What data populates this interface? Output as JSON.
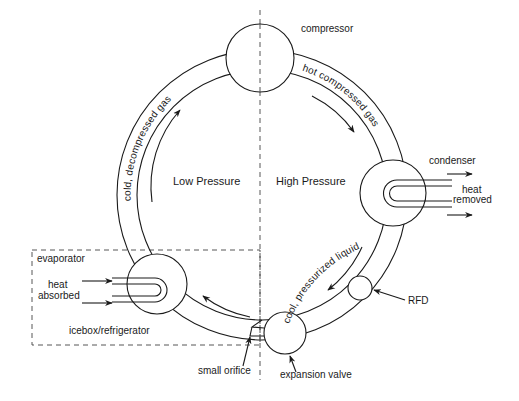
{
  "diagram": {
    "regions": {
      "low_pressure": "Low Pressure",
      "high_pressure": "High Pressure"
    },
    "components": {
      "compressor": "compressor",
      "condenser": "condenser",
      "rfd": "RFD",
      "expansion_valve": "expansion valve",
      "small_orifice": "small orifice",
      "evaporator": "evaporator",
      "icebox": "icebox/refrigerator"
    },
    "heat_labels": {
      "removed_line1": "heat",
      "removed_line2": "removed",
      "absorbed_line1": "heat",
      "absorbed_line2": "absorbed"
    },
    "pipe_labels": {
      "cold_gas": "cold, decompressed gas",
      "hot_gas": "hot compressed gas",
      "cool_liquid": "cool, pressurized liquid"
    },
    "colors": {
      "line": "#1a1a1a",
      "background": "#ffffff"
    }
  }
}
